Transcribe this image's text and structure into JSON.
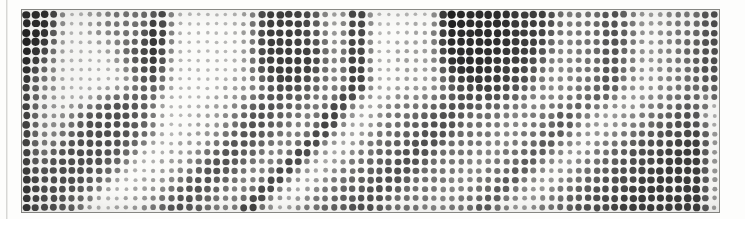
{
  "image": {
    "kind": "halftone-dot-matrix-scan",
    "caption": "",
    "medium": "scanned newsprint halftone",
    "colors": {
      "paper": "#fbfbf9",
      "page_background": "#fdfdfc",
      "ink": "#1c1c1c",
      "plate_border": "#8e8e8a",
      "scan_seam": "#d7d7d5"
    },
    "plate": {
      "left": 21,
      "top": 9,
      "width": 699,
      "height": 204,
      "border_width": 1
    },
    "screen": {
      "columns": 77,
      "rows": 22,
      "pitch_px": 9.05,
      "dot_shape": "round",
      "max_dot_diameter_px": 8.2,
      "min_dot_diameter_px": 1.4,
      "angle_deg": 0,
      "ink_opacity_range": [
        0.1,
        1.0
      ]
    },
    "chart_data": {
      "type": "heatmap",
      "title": "",
      "xlabel": "",
      "ylabel": "",
      "grid": false,
      "legend": "none",
      "note": "Per-cell ink coverage 0-9 (0 = blank paper, 9 = solid ink) for the 77x22 halftone screen.",
      "vmin": 0,
      "vmax": 9,
      "rows": [
        "88882112234444482111111122777776622188111111119988888877776434446653222343466",
        "88871112344444882111111124777776632188111112119988888877776434446654222344466",
        "98861112334445882111111123777776632288111112229888888877775434446654223344466",
        "98851111223456882111111123777776642288111222228888888877774334446654223345566",
        "97741111123566872111111124777777743388211222228888888777764334446644223345566",
        "96631111112466871111111124777777743388211222227888887777653334446644223344566",
        "95531111111356761111111124677777643388211222226788887776643334446644223344566",
        "94431111111246651111111223567776543388211222225677777766533334446633223344556",
        "84331111112245551111112223456665543388221222224566777665433334446633223344556",
        "843211113455555111111222345665554338822123333455666665543333444663222334455 6",
        "8432123456666551111122234566555433882212344445566655544333444663322233445566",
        "843234566666554111122234566554433882212344455666544443334446633222334455666",
        "8432345666665541111222345665543338822123445556665444433344466332223344556666",
        "8433456666665541112223456655433388221234455566654444333444663322334455666677",
        "8434566666655411122234566554333882212344555666544443334446633223445566667777",
        "8445666666554111222345665543338822123445556665444433344466332234455666677777",
        "8456666665541112223456655433388221234455566654444333444663322344556666777777",
        "8566666655411122234566554333882212344555666544443334446633223445566667777777",
        "8666666554111222345665543338822123445556665444433344466332234455666677777777",
        "8666665541112223456655433388221234455566654444333444663322344556666777777777",
        "8666655411122234566554333882212344555666544443334446633223445566667777777777",
        "8666554111222345665543338822123445556665444433344466332234455666677777777777"
      ]
    },
    "annotations": {
      "labels": [],
      "axis_ticks": [],
      "legend_entries": []
    }
  }
}
